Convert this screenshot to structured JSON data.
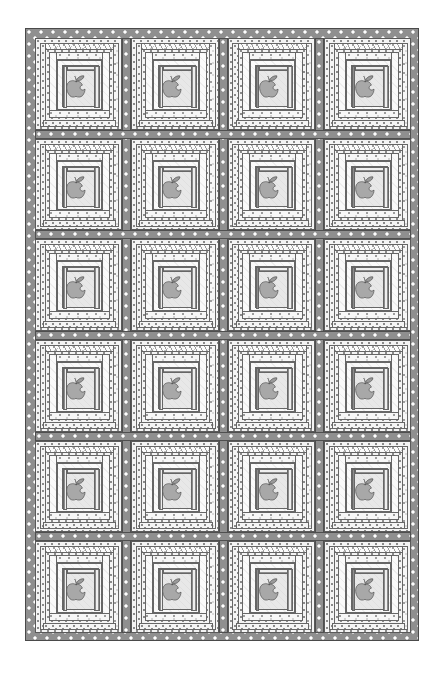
{
  "artwork": {
    "title": "Apple Block Quilt Layout",
    "type": "quilt-diagram",
    "subject": "apple",
    "background_color": "#ffffff"
  },
  "quilt": {
    "x": 25,
    "y": 28,
    "width": 394,
    "height": 613,
    "rows": 6,
    "columns": 4,
    "total_blocks": 24,
    "outer_border_width": 9,
    "sashing_width": 9
  },
  "palette": {
    "border_fabric": "#8f8f8f",
    "border_dot": "#ffffff",
    "sashing_fabric": "#8f8f8f",
    "apple_body": "#a8a8a8",
    "apple_outline": "#4a4a4a",
    "apple_leaf": "#9a9a9a",
    "apple_background": "#e8e8e8",
    "stripe_dark": "#8c8c8c",
    "stripe_light": "#efefef",
    "outline": "#5a5a5a"
  },
  "block": {
    "name": "apple-log-cabin-block",
    "rings": [
      {
        "name": "outer-ring-top",
        "fabric": "squiggle-print"
      },
      {
        "name": "outer-ring-left",
        "fabric": "fine-dot-print"
      },
      {
        "name": "outer-ring-right",
        "fabric": "speckle-print"
      },
      {
        "name": "outer-ring-bottom",
        "fabric": "fine-dot-print"
      },
      {
        "name": "mid-ring-top",
        "fabric": "speckle-print"
      },
      {
        "name": "mid-ring-left",
        "fabric": "plain-tone-on-tone"
      },
      {
        "name": "mid-ring-right",
        "fabric": "plain-tone-on-tone"
      },
      {
        "name": "mid-ring-bottom",
        "fabric": "speckle-print"
      },
      {
        "name": "inner-stripe-top",
        "fabric": "horizontal-stripe"
      },
      {
        "name": "inner-stripe-right",
        "fabric": "vertical-stripe"
      },
      {
        "name": "inner-stripe-left",
        "fabric": "vertical-stripe"
      },
      {
        "name": "apple-center-panel",
        "fabric": "light-solid"
      }
    ]
  },
  "apple": {
    "name": "apple-motif",
    "has_leaf": true,
    "has_stem": true,
    "has_bite": true,
    "bite_side": "right",
    "fill": "#a8a8a8",
    "outline": "#4a4a4a"
  },
  "grid": {
    "block_labels": [
      [
        "R1C1",
        "R1C2",
        "R1C3",
        "R1C4"
      ],
      [
        "R2C1",
        "R2C2",
        "R2C3",
        "R2C4"
      ],
      [
        "R3C1",
        "R3C2",
        "R3C3",
        "R3C4"
      ],
      [
        "R4C1",
        "R4C2",
        "R4C3",
        "R4C4"
      ],
      [
        "R5C1",
        "R5C2",
        "R5C3",
        "R5C4"
      ],
      [
        "R6C1",
        "R6C2",
        "R6C3",
        "R6C4"
      ]
    ]
  }
}
